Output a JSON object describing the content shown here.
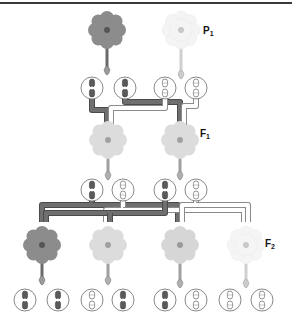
{
  "figure": {
    "type": "genetics-cross-diagram",
    "colors": {
      "top_rule": "#3a3a3a",
      "dominant_path": "#6f6f6f",
      "dominant_path_edge": "#4a4a4a",
      "recessive_path": "#ffffff",
      "recessive_path_edge": "#8a8a8a",
      "circle_stroke": "#7a7a7a",
      "dark_chromosome": "#5a5a5a",
      "light_chromosome": "#ffffff"
    }
  },
  "generations": [
    {
      "id": "P",
      "label_main": "P",
      "label_sub": "1",
      "flowers": [
        {
          "phenotype": "red",
          "shade": "#8c8c8c",
          "center": "#555555"
        },
        {
          "phenotype": "white",
          "shade": "#f3f3f3",
          "center": "#c8c8c8"
        }
      ],
      "genotypes": [
        {
          "alleles": [
            "dark",
            "dark"
          ]
        },
        {
          "alleles": [
            "light",
            "light"
          ]
        }
      ]
    },
    {
      "id": "F1",
      "label_main": "F",
      "label_sub": "1",
      "flowers": [
        {
          "phenotype": "pink",
          "shade": "#dcdcdc",
          "center": "#a0a0a0"
        },
        {
          "phenotype": "pink",
          "shade": "#dcdcdc",
          "center": "#a0a0a0"
        }
      ],
      "genotypes": [
        {
          "alleles": [
            "dark",
            "light"
          ]
        },
        {
          "alleles": [
            "dark",
            "light"
          ]
        }
      ]
    },
    {
      "id": "F2",
      "label_main": "F",
      "label_sub": "2",
      "flowers": [
        {
          "phenotype": "red",
          "shade": "#8c8c8c",
          "center": "#555555"
        },
        {
          "phenotype": "pink",
          "shade": "#dcdcdc",
          "center": "#a0a0a0"
        },
        {
          "phenotype": "pink",
          "shade": "#d6d6d6",
          "center": "#9a9a9a"
        },
        {
          "phenotype": "white",
          "shade": "#f5f5f5",
          "center": "#c8c8c8"
        }
      ],
      "genotypes": [
        {
          "alleles": [
            "dark",
            "dark"
          ]
        },
        {
          "alleles": [
            "light",
            "dark"
          ]
        },
        {
          "alleles": [
            "dark",
            "light"
          ]
        },
        {
          "alleles": [
            "light",
            "light"
          ]
        }
      ]
    }
  ]
}
